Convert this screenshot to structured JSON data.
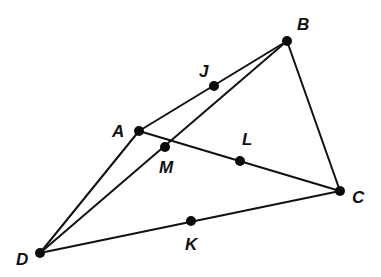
{
  "diagram": {
    "points": [
      {
        "id": "A",
        "label": "A",
        "x": 139,
        "y": 131,
        "lx": 112,
        "ly": 137
      },
      {
        "id": "B",
        "label": "B",
        "x": 287,
        "y": 41,
        "lx": 297,
        "ly": 30
      },
      {
        "id": "C",
        "label": "C",
        "x": 340,
        "y": 191,
        "lx": 352,
        "ly": 203
      },
      {
        "id": "D",
        "label": "D",
        "x": 40,
        "y": 253,
        "lx": 16,
        "ly": 265
      },
      {
        "id": "J",
        "label": "J",
        "x": 214,
        "y": 86,
        "lx": 199,
        "ly": 77
      },
      {
        "id": "K",
        "label": "K",
        "x": 191,
        "y": 221,
        "lx": 185,
        "ly": 250
      },
      {
        "id": "L",
        "label": "L",
        "x": 240,
        "y": 161,
        "lx": 242,
        "ly": 145
      },
      {
        "id": "M",
        "label": "M",
        "x": 165,
        "y": 147,
        "lx": 159,
        "ly": 173
      }
    ],
    "segments": [
      {
        "from": "A",
        "to": "B"
      },
      {
        "from": "B",
        "to": "C"
      },
      {
        "from": "A",
        "to": "C"
      },
      {
        "from": "D",
        "to": "A"
      },
      {
        "from": "D",
        "to": "B"
      },
      {
        "from": "D",
        "to": "C"
      }
    ],
    "colors": {
      "line": "#111111",
      "point": "#0a0a0a",
      "background": "#ffffff"
    }
  }
}
